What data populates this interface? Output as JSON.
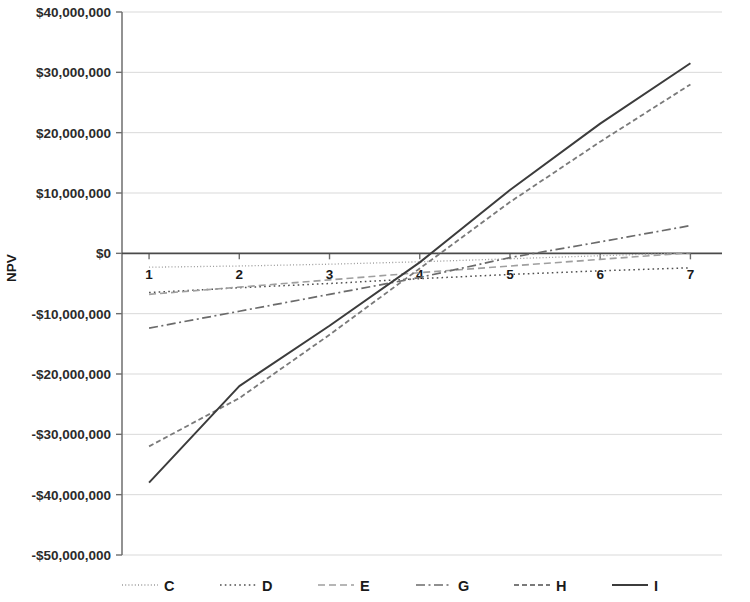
{
  "chart_data": {
    "type": "line",
    "title": "",
    "subtitle": "",
    "xlabel": "",
    "ylabel": "NPV",
    "x": [
      1,
      2,
      3,
      4,
      5,
      6,
      7
    ],
    "xlim": [
      0.7,
      7.35
    ],
    "ylim": [
      -50000000,
      40000000
    ],
    "grid": true,
    "legend_position": "bottom",
    "y_ticks": [
      40000000,
      30000000,
      20000000,
      10000000,
      0,
      -10000000,
      -20000000,
      -30000000,
      -40000000,
      -50000000
    ],
    "y_tick_labels": [
      "$40,000,000",
      "$30,000,000",
      "$20,000,000",
      "$10,000,000",
      "$0",
      "-$10,000,000",
      "-$20,000,000",
      "-$30,000,000",
      "-$40,000,000",
      "-$50,000,000"
    ],
    "x_tick_labels": [
      "1",
      "2",
      "3",
      "4",
      "5",
      "6",
      "7"
    ],
    "series": [
      {
        "name": "C",
        "style": "dotted-fine",
        "color": "#9a9a9a",
        "width": 1.3,
        "dash": "1,2.2",
        "values": [
          -2300000,
          -2100000,
          -1800000,
          -1400000,
          -900000,
          -400000,
          100000
        ]
      },
      {
        "name": "D",
        "style": "dotted-coarse",
        "color": "#4f4f4f",
        "width": 1.5,
        "dash": "1.6,3.2",
        "values": [
          -6500000,
          -5700000,
          -5000000,
          -4200000,
          -3500000,
          -2900000,
          -2400000
        ]
      },
      {
        "name": "E",
        "style": "dashed-long",
        "color": "#9f9f9f",
        "width": 1.6,
        "dash": "7,4",
        "values": [
          -6800000,
          -5600000,
          -4400000,
          -3200000,
          -2100000,
          -1000000,
          100000
        ]
      },
      {
        "name": "G",
        "style": "dash-dot",
        "color": "#6b6b6b",
        "width": 1.7,
        "dash": "9,3.5,2,3.5",
        "values": [
          -12400000,
          -9600000,
          -6800000,
          -4000000,
          -700000,
          1900000,
          4600000
        ]
      },
      {
        "name": "H",
        "style": "dashed-short",
        "color": "#7a7a7a",
        "width": 1.8,
        "dash": "5,3",
        "values": [
          -32000000,
          -24000000,
          -13500000,
          -2500000,
          8500000,
          18500000,
          28000000
        ]
      },
      {
        "name": "I",
        "style": "solid",
        "color": "#3c3c3c",
        "width": 2.0,
        "values": [
          -38000000,
          -22000000,
          -12000000,
          -1500000,
          10500000,
          21500000,
          31500000
        ]
      }
    ]
  },
  "legend": {
    "entries": [
      {
        "label": "C"
      },
      {
        "label": "D"
      },
      {
        "label": "E"
      },
      {
        "label": "G"
      },
      {
        "label": "H"
      },
      {
        "label": "I"
      }
    ]
  },
  "axes": {
    "y_axis_title": "NPV"
  }
}
